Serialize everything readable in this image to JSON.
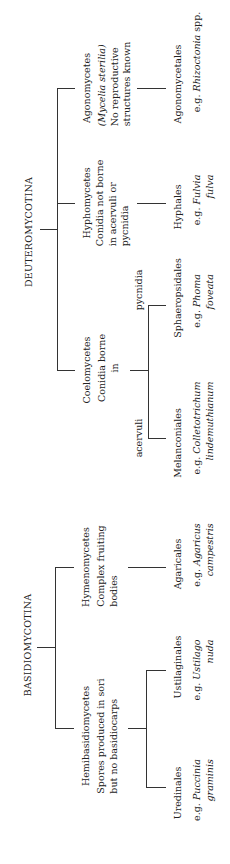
{
  "diagram": {
    "orientation": "rotated 90 degrees counter-clockwise",
    "line_color": "#333333",
    "background": "#ffffff",
    "subdivisions": [
      {
        "name": "BASIDIOMYCOTINA",
        "classes": [
          {
            "name": "Hemibasidiomycetes",
            "description": [
              "Spores produced in sori",
              "but no basidiocarps"
            ],
            "orders": [
              {
                "name": "Uredinales",
                "example_prefix": "e.g.",
                "example": [
                  "Puccinia",
                  "graminis"
                ]
              },
              {
                "name": "Ustilaginales",
                "example_prefix": "e.g.",
                "example": [
                  "Ustilago",
                  "nuda"
                ]
              }
            ]
          },
          {
            "name": "Hymenomycetes",
            "description": [
              "Complex fruiting",
              "bodies"
            ],
            "orders": [
              {
                "name": "Agaricales",
                "example_prefix": "e.g.",
                "example": [
                  "Agaricus",
                  "campestris"
                ]
              }
            ]
          }
        ]
      },
      {
        "name": "DEUTEROMYCOTINA",
        "classes": [
          {
            "name": "Coelomycetes",
            "description": [
              "Conidia borne",
              "in"
            ],
            "branch_labels": [
              "acervuli",
              "pycnidia"
            ],
            "orders": [
              {
                "name": "Melanconiales",
                "example_prefix": "e.g.",
                "example": [
                  "Colletotrichum",
                  "lindemuthianum"
                ]
              },
              {
                "name": "Sphaeropsidales",
                "example_prefix": "e.g.",
                "example": [
                  "Phoma",
                  "foveata"
                ]
              }
            ]
          },
          {
            "name": "Hyphomycetes",
            "description": [
              "Conidia not borne",
              "in acervuli or",
              "pycnidia"
            ],
            "orders": [
              {
                "name": "Hyphales",
                "example_prefix": "e.g.",
                "example": [
                  "Fulvia",
                  "fulva"
                ]
              }
            ]
          },
          {
            "name": "Agonomycetes",
            "description": [
              "(Mycelia sterilia)",
              "No reproductive",
              "structures known"
            ],
            "orders": [
              {
                "name": "Agonomycetales",
                "example_prefix": "e.g.",
                "example": [
                  "Rhizoctonia",
                  "spp."
                ]
              }
            ]
          }
        ]
      }
    ]
  }
}
